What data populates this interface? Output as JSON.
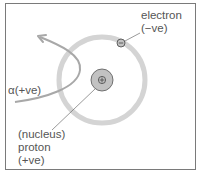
{
  "diagram": {
    "title": "",
    "labels": {
      "electron": "electron",
      "electron_charge": "(−ve)",
      "alpha": "α(+ve)",
      "nucleus": "(nucleus)",
      "proton": "proton",
      "proton_charge": "(+ve)"
    },
    "symbols": {
      "electron_symbol": "minus-in-circle",
      "nucleus_symbol": "plus-in-circle"
    },
    "colors": {
      "orbit": "#d4d4d4",
      "nucleus_fill": "#c2c2c2",
      "outline": "#555555",
      "alpha_path": "#a8a8a8",
      "text": "#555555",
      "frame": "#7a7a7a"
    }
  }
}
